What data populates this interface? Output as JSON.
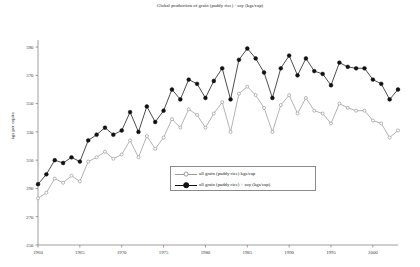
{
  "chart_data": {
    "type": "line",
    "title": "Global production of grain (paddy rice) +soy (kgs/cap)",
    "xlabel": "",
    "ylabel": "kgs per capita",
    "xlim": [
      1960,
      2003
    ],
    "ylim": [
      250,
      395
    ],
    "y_ticks": [
      250,
      270,
      290,
      310,
      330,
      350,
      370,
      390
    ],
    "x_ticks": [
      1960,
      1965,
      1970,
      1975,
      1980,
      1985,
      1990,
      1995,
      2000
    ],
    "grid": false,
    "legend_position": "center-bottom",
    "x": [
      1960,
      1961,
      1962,
      1963,
      1964,
      1965,
      1966,
      1967,
      1968,
      1969,
      1970,
      1971,
      1972,
      1973,
      1974,
      1975,
      1976,
      1977,
      1978,
      1979,
      1980,
      1981,
      1982,
      1983,
      1984,
      1985,
      1986,
      1987,
      1988,
      1989,
      1990,
      1991,
      1992,
      1993,
      1994,
      1995,
      1996,
      1997,
      1998,
      1999,
      2000,
      2001,
      2002,
      2003
    ],
    "series": [
      {
        "name": "all grain (paddy rice) kgs/cap",
        "color": "#9a9a9a",
        "marker": "circle-open",
        "values": [
          283,
          287,
          297,
          294,
          299,
          295,
          309,
          312,
          316,
          311,
          314,
          324,
          312,
          327,
          318,
          326,
          339,
          333,
          346,
          342,
          333,
          343,
          351,
          330,
          357,
          362,
          356,
          347,
          330,
          349,
          356,
          343,
          354,
          345,
          343,
          336,
          350,
          347,
          345,
          345,
          338,
          336,
          326,
          331
        ]
      },
      {
        "name": "all grain (paddy rice) + soy (kgs/cap)",
        "color": "#111111",
        "marker": "circle-filled",
        "values": [
          293,
          300,
          310,
          308,
          312,
          309,
          324,
          328,
          333,
          328,
          331,
          344,
          330,
          348,
          337,
          345,
          360,
          353,
          367,
          364,
          354,
          366,
          375,
          353,
          381,
          389,
          382,
          372,
          354,
          375,
          384,
          370,
          382,
          373,
          371,
          363,
          379,
          376,
          375,
          375,
          367,
          364,
          353,
          360
        ]
      }
    ]
  },
  "legend": {
    "items": [
      {
        "label": "all grain (paddy rice) kgs/cap"
      },
      {
        "label": "all grain (paddy rice) + soy (kgs/cap)"
      }
    ]
  },
  "axes": {
    "y_title": "kgs per capita"
  }
}
